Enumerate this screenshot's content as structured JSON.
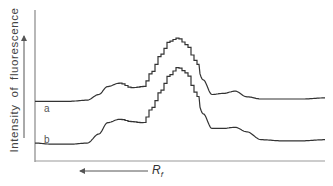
{
  "chart_data": {
    "type": "line",
    "title": "",
    "xlabel": "R_f",
    "xlabel_main": "R",
    "xlabel_sub": "f",
    "xlabel_arrow": "left",
    "ylabel": "Intensity of fluorescence",
    "ylabel_arrow": "up",
    "grid": false,
    "ticks": "none",
    "x": [
      0,
      0.06,
      0.12,
      0.18,
      0.22,
      0.25,
      0.29,
      0.33,
      0.37,
      0.4,
      0.43,
      0.46,
      0.49,
      0.52,
      0.55,
      0.58,
      0.61,
      0.65,
      0.69,
      0.73,
      0.78,
      0.85,
      0.92,
      1.0
    ],
    "series": [
      {
        "name": "a",
        "label": "a",
        "values": [
          0.44,
          0.44,
          0.44,
          0.45,
          0.5,
          0.57,
          0.6,
          0.56,
          0.57,
          0.7,
          0.85,
          0.97,
          1.0,
          0.94,
          0.8,
          0.63,
          0.5,
          0.51,
          0.53,
          0.48,
          0.46,
          0.46,
          0.46,
          0.47
        ]
      },
      {
        "name": "b",
        "label": "b",
        "values": [
          0.07,
          0.06,
          0.06,
          0.07,
          0.15,
          0.25,
          0.28,
          0.26,
          0.25,
          0.38,
          0.53,
          0.67,
          0.74,
          0.69,
          0.52,
          0.33,
          0.2,
          0.2,
          0.21,
          0.17,
          0.1,
          0.09,
          0.09,
          0.1
        ]
      }
    ]
  },
  "labels": {
    "ylabel": "Intensity of fluorescence",
    "curve_a": "a",
    "curve_b": "b",
    "x_main": "R",
    "x_sub": "f"
  }
}
